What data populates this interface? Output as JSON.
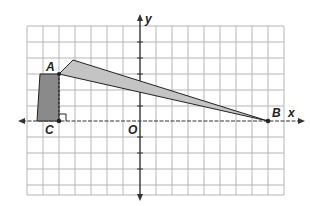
{
  "diagram": {
    "axes": {
      "x_label": "x",
      "y_label": "y",
      "origin_label": "O"
    },
    "points": [
      {
        "name": "A",
        "label": "A"
      },
      {
        "name": "B",
        "label": "B"
      },
      {
        "name": "C",
        "label": "C"
      }
    ],
    "colors": {
      "grid": "#b5b5b5",
      "axis": "#333333",
      "tower_fill": "#8a8a8a",
      "beam_fill": "#c4c4c4",
      "outline": "#222222"
    }
  }
}
